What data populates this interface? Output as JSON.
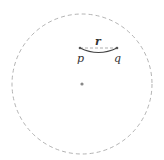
{
  "diagram": {
    "circle": {
      "cx": 82,
      "cy": 84,
      "r": 70,
      "stroke": "#aaaaaa",
      "style": "dashed"
    },
    "center_point": {
      "cx": 82,
      "cy": 84,
      "color": "#888888"
    },
    "points": [
      {
        "label": "p",
        "x": 80,
        "y": 48
      },
      {
        "label": "q",
        "x": 117,
        "y": 48
      }
    ],
    "segment_label": "r",
    "arc_color": "#444444"
  }
}
